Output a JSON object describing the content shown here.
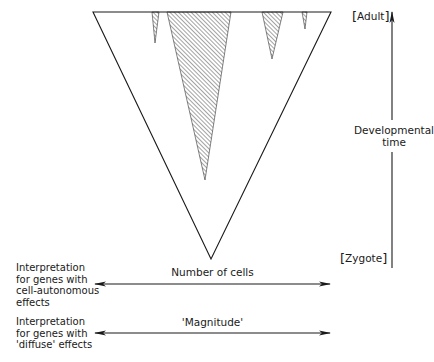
{
  "diagram": {
    "type": "developmental-lineage-cone",
    "time_axis": {
      "label_line1": "Developmental",
      "label_line2": "time",
      "top_label": "Adult",
      "bottom_label": "Zygote",
      "bracket_open": "[",
      "bracket_close": "]"
    },
    "cone": {
      "top_left": [
        93,
        12
      ],
      "top_right": [
        331,
        12
      ],
      "apex": [
        211,
        259
      ],
      "shaded_wedges": [
        {
          "name": "wedge-small-left",
          "left": 152,
          "right": 159,
          "apex": [
            155,
            43
          ]
        },
        {
          "name": "wedge-large",
          "left": 167,
          "right": 231,
          "apex": [
            205,
            180
          ]
        },
        {
          "name": "wedge-medium-right",
          "left": 262,
          "right": 283,
          "apex": [
            272,
            59
          ]
        },
        {
          "name": "wedge-tiny-right",
          "left": 302,
          "right": 307,
          "apex": [
            305,
            29
          ]
        }
      ]
    },
    "interpretations": [
      {
        "caption_lines": [
          "Interpretation",
          "for genes with",
          "cell-autonomous",
          "effects"
        ],
        "axis_label": "Number of cells"
      },
      {
        "caption_lines": [
          "Interpretation",
          "for genes with",
          "'diffuse' effects"
        ],
        "axis_label": "'Magnitude'"
      }
    ],
    "colors": {
      "line": "#1a1a1a",
      "hatch": "#333333",
      "background": "#ffffff"
    }
  }
}
